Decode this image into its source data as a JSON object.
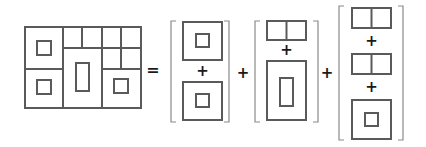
{
  "diagram": {
    "colors": {
      "stroke": "#5a5a5a",
      "bracket": "#8a8a8a",
      "operator": "#1a1a1a",
      "background": "#ffffff"
    },
    "operators": {
      "equals": "=",
      "plus": "+"
    },
    "composite": {
      "label": "Composite plan (3 columns)",
      "columns": [
        {
          "name": "left",
          "cells": [
            "square-with-small-square",
            "square-with-small-square"
          ]
        },
        {
          "name": "middle",
          "cells": [
            "double-cell",
            "tall-rect-with-inner-rect"
          ]
        },
        {
          "name": "right",
          "cells": [
            "double-cell",
            "double-cell",
            "square-with-small-square"
          ]
        }
      ]
    },
    "groups": [
      {
        "name": "group-1",
        "terms": [
          "square-with-small-square",
          "square-with-small-square"
        ]
      },
      {
        "name": "group-2",
        "terms": [
          "double-cell",
          "tall-rect-with-inner-rect"
        ]
      },
      {
        "name": "group-3",
        "terms": [
          "double-cell",
          "double-cell",
          "square-with-small-square"
        ]
      }
    ]
  }
}
